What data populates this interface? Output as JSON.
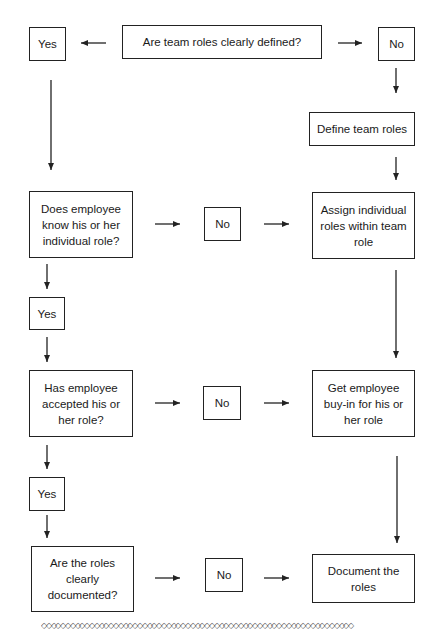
{
  "flowchart": {
    "nodes": {
      "q_team_roles": "Are team roles clearly defined?",
      "yes_1": "Yes",
      "no_1": "No",
      "define_team_roles": "Define team roles",
      "q_know_role": "Does employee know his or her individual role?",
      "no_2": "No",
      "assign_roles": "Assign individual roles within team role",
      "yes_2": "Yes",
      "q_accepted_role": "Has employee accepted his or her role?",
      "no_3": "No",
      "get_buy_in": "Get employee buy-in for his or her role",
      "yes_3": "Yes",
      "q_documented": "Are the roles clearly documented?",
      "no_4": "No",
      "document_roles": "Document the roles"
    },
    "edges": [
      [
        "q_team_roles",
        "yes_1"
      ],
      [
        "q_team_roles",
        "no_1"
      ],
      [
        "no_1",
        "define_team_roles"
      ],
      [
        "define_team_roles",
        "assign_roles"
      ],
      [
        "yes_1",
        "q_know_role"
      ],
      [
        "q_know_role",
        "no_2"
      ],
      [
        "no_2",
        "assign_roles"
      ],
      [
        "q_know_role",
        "yes_2"
      ],
      [
        "yes_2",
        "q_accepted_role"
      ],
      [
        "assign_roles",
        "get_buy_in"
      ],
      [
        "q_accepted_role",
        "no_3"
      ],
      [
        "no_3",
        "get_buy_in"
      ],
      [
        "q_accepted_role",
        "yes_3"
      ],
      [
        "yes_3",
        "q_documented"
      ],
      [
        "get_buy_in",
        "document_roles"
      ],
      [
        "q_documented",
        "no_4"
      ],
      [
        "no_4",
        "document_roles"
      ]
    ]
  },
  "footer": {
    "border_pattern": "◇◇◇◇◇◇◇◇◇◇◇◇◇◇◇◇◇◇◇◇◇◇◇◇◇◇◇◇◇◇◇◇◇◇◇◇◇◇◇◇◇◇◇◇◇◇◇◇◇◇◇◇◇◇◇◇◇◇◇◇◇◇◇◇◇"
  }
}
